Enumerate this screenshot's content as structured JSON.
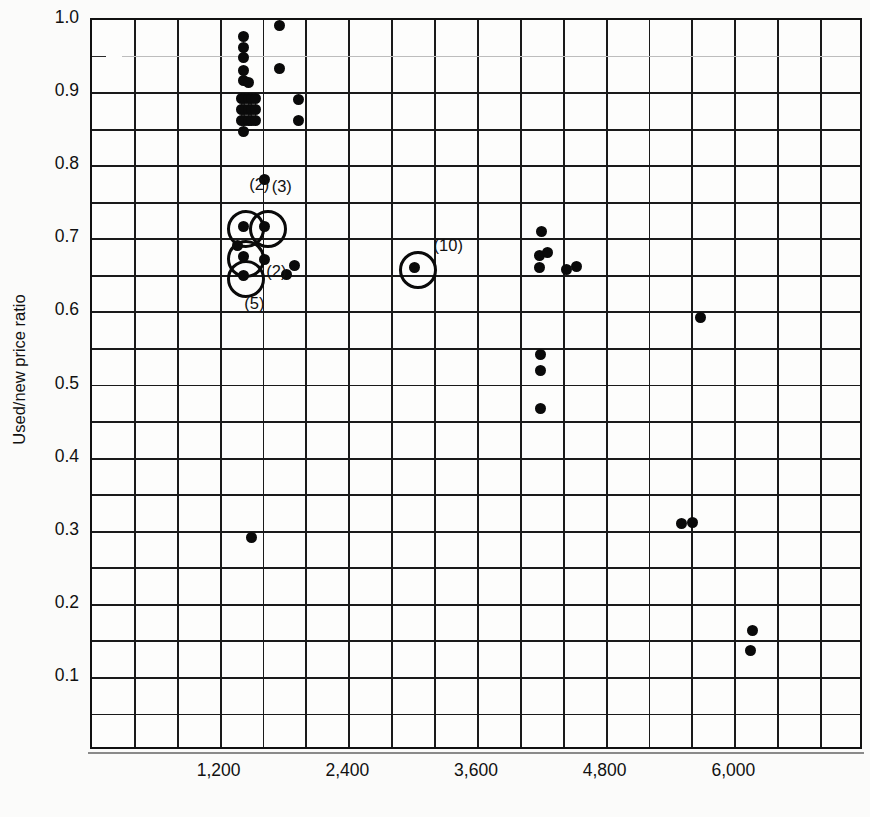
{
  "chart": {
    "type": "scatter",
    "title": "",
    "xlabel": "",
    "ylabel": "Used/new price ratio",
    "xticks": [
      "1,200",
      "2,400",
      "3,600",
      "4,800",
      "6,000"
    ],
    "xtick_values": [
      1200,
      2400,
      3600,
      4800,
      6000
    ],
    "yticks": [
      "1.0",
      "0.9",
      "0.8",
      "0.7",
      "0.6",
      "0.5",
      "0.4",
      "0.3",
      "0.2",
      "0.1"
    ],
    "ytick_values": [
      1.0,
      0.9,
      0.8,
      0.7,
      0.6,
      0.5,
      0.4,
      0.3,
      0.2,
      0.1
    ],
    "xlim": [
      0,
      7200
    ],
    "ylim": [
      0.0,
      1.0
    ],
    "grid": "on",
    "grid_x_step": 400,
    "grid_y_step": 0.05,
    "legend": "none",
    "marker": "filled-circle",
    "marker_color": "#0a0a0a"
  },
  "chart_data": {
    "type": "scatter",
    "title": "",
    "xlabel": "",
    "ylabel": "Used/new price ratio",
    "xlim": [
      0,
      7200
    ],
    "ylim": [
      0.0,
      1.0
    ],
    "grid": true,
    "legend": "none",
    "xticks": [
      "1,200",
      "2,400",
      "3,600",
      "4,800",
      "6,000"
    ],
    "yticks": [
      "0.1",
      "0.2",
      "0.3",
      "0.4",
      "0.5",
      "0.6",
      "0.7",
      "0.8",
      "0.9",
      "1.0"
    ],
    "annotations": [
      {
        "text": "(2)",
        "x": 1410,
        "y": 0.775
      },
      {
        "text": "(3)",
        "x": 1620,
        "y": 0.773
      },
      {
        "text": "(2)",
        "x": 1570,
        "y": 0.657
      },
      {
        "text": "(5)",
        "x": 1365,
        "y": 0.613
      },
      {
        "text": "(10)",
        "x": 3130,
        "y": 0.692
      }
    ],
    "points": [
      {
        "x": 1410,
        "y": 0.978,
        "n": 1
      },
      {
        "x": 1410,
        "y": 0.963,
        "n": 1
      },
      {
        "x": 1410,
        "y": 0.949,
        "n": 1
      },
      {
        "x": 1745,
        "y": 0.993,
        "n": 1
      },
      {
        "x": 1410,
        "y": 0.931,
        "n": 1
      },
      {
        "x": 1410,
        "y": 0.917,
        "n": 1
      },
      {
        "x": 1463,
        "y": 0.914,
        "n": 1
      },
      {
        "x": 1745,
        "y": 0.933,
        "n": 1
      },
      {
        "x": 1390,
        "y": 0.893,
        "n": 1
      },
      {
        "x": 1424,
        "y": 0.893,
        "n": 1
      },
      {
        "x": 1458,
        "y": 0.893,
        "n": 1
      },
      {
        "x": 1492,
        "y": 0.893,
        "n": 1
      },
      {
        "x": 1526,
        "y": 0.893,
        "n": 1
      },
      {
        "x": 1390,
        "y": 0.878,
        "n": 1
      },
      {
        "x": 1424,
        "y": 0.878,
        "n": 1
      },
      {
        "x": 1458,
        "y": 0.878,
        "n": 1
      },
      {
        "x": 1492,
        "y": 0.878,
        "n": 1
      },
      {
        "x": 1526,
        "y": 0.878,
        "n": 1
      },
      {
        "x": 1390,
        "y": 0.862,
        "n": 1
      },
      {
        "x": 1424,
        "y": 0.862,
        "n": 1
      },
      {
        "x": 1458,
        "y": 0.862,
        "n": 1
      },
      {
        "x": 1492,
        "y": 0.862,
        "n": 1
      },
      {
        "x": 1526,
        "y": 0.862,
        "n": 1
      },
      {
        "x": 1415,
        "y": 0.848,
        "n": 1
      },
      {
        "x": 1925,
        "y": 0.891,
        "n": 1
      },
      {
        "x": 1925,
        "y": 0.862,
        "n": 1
      },
      {
        "x": 1612,
        "y": 0.782,
        "n": 1
      },
      {
        "x": 1410,
        "y": 0.718,
        "n": 2,
        "circled": true
      },
      {
        "x": 1612,
        "y": 0.718,
        "n": 2,
        "circled": true
      },
      {
        "x": 1355,
        "y": 0.691,
        "n": 1
      },
      {
        "x": 1410,
        "y": 0.677,
        "n": 5,
        "circled": true
      },
      {
        "x": 1612,
        "y": 0.672,
        "n": 2
      },
      {
        "x": 1410,
        "y": 0.65,
        "n": 1,
        "circled": true
      },
      {
        "x": 1893,
        "y": 0.664,
        "n": 1
      },
      {
        "x": 1815,
        "y": 0.652,
        "n": 1
      },
      {
        "x": 3010,
        "y": 0.662,
        "n": 10,
        "circled": true
      },
      {
        "x": 4190,
        "y": 0.71,
        "n": 1
      },
      {
        "x": 4170,
        "y": 0.678,
        "n": 1
      },
      {
        "x": 4245,
        "y": 0.682,
        "n": 1
      },
      {
        "x": 4170,
        "y": 0.662,
        "n": 1
      },
      {
        "x": 4430,
        "y": 0.659,
        "n": 1
      },
      {
        "x": 4520,
        "y": 0.663,
        "n": 1
      },
      {
        "x": 5675,
        "y": 0.593,
        "n": 1
      },
      {
        "x": 4185,
        "y": 0.543,
        "n": 1
      },
      {
        "x": 4185,
        "y": 0.521,
        "n": 1
      },
      {
        "x": 4185,
        "y": 0.468,
        "n": 1
      },
      {
        "x": 1490,
        "y": 0.292,
        "n": 1
      },
      {
        "x": 5500,
        "y": 0.311,
        "n": 1
      },
      {
        "x": 5600,
        "y": 0.313,
        "n": 1
      },
      {
        "x": 6160,
        "y": 0.165,
        "n": 1
      },
      {
        "x": 6140,
        "y": 0.137,
        "n": 1
      }
    ]
  }
}
